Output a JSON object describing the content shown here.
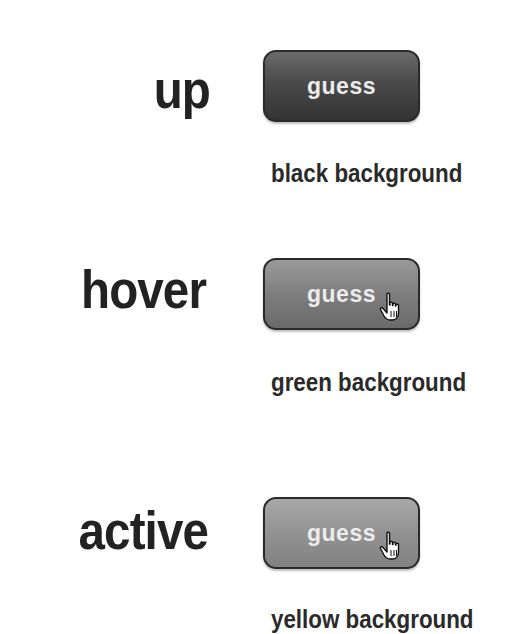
{
  "states": [
    {
      "label": "up",
      "button_text": "guess",
      "caption": "black background",
      "cursor": null
    },
    {
      "label": "hover",
      "button_text": "guess",
      "caption": "green background",
      "cursor": "hand-pointer-icon"
    },
    {
      "label": "active",
      "button_text": "guess",
      "caption": "yellow background",
      "cursor": "hand-pointer-icon"
    }
  ],
  "colors": {
    "label_text": "#222222",
    "button_border": "#2a2a2a",
    "button_up_fill": "#4a4a4a",
    "button_hover_fill": "#7e7e7e",
    "button_active_fill": "#929292",
    "button_text": "#ececec",
    "caption_text": "#2a2a2a"
  }
}
